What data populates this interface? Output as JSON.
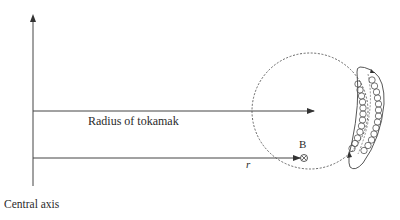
{
  "diagram": {
    "labels": {
      "radius": "Radius of tokamak",
      "central_axis": "Central axis",
      "r": "r",
      "b_field": "B"
    },
    "symbols": {
      "b_field_direction": "into-page (⊗)"
    },
    "colors": {
      "line": "#333333",
      "background": "#ffffff"
    }
  }
}
